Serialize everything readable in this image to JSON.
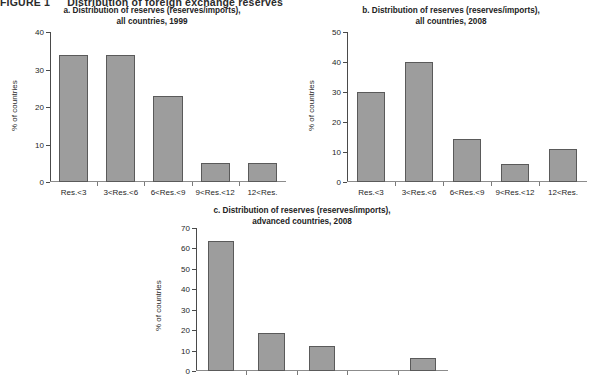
{
  "figure": {
    "label": "FIGURE 1",
    "caption": "Distribution of foreign exchange reserves",
    "ylabel": "% of countries",
    "bar_color": "#9d9d9d",
    "axis_color": "#4a4a4a"
  },
  "chart_data": [
    {
      "id": "a",
      "type": "bar",
      "title": "a. Distribution of reserves (reserves/imports),",
      "subtitle": "all countries, 1999",
      "categories": [
        "Res.<3",
        "3<Res.<6",
        "6<Res.<9",
        "9<Res.<12",
        "12<Res."
      ],
      "values": [
        33.8,
        33.8,
        23.0,
        5.2,
        5.2
      ],
      "xlabel": "",
      "ylabel": "% of countries",
      "ylim": [
        0,
        40
      ],
      "yticks": [
        0,
        10,
        20,
        30,
        40
      ],
      "grid": false,
      "legend": "none"
    },
    {
      "id": "b",
      "type": "bar",
      "title": "b. Distribution of reserves (reserves/imports),",
      "subtitle": "all countries, 2008",
      "categories": [
        "Res.<3",
        "3<Res.<6",
        "6<Res.<9",
        "9<Res.<12",
        "12<Res."
      ],
      "values": [
        30.0,
        40.0,
        14.5,
        6.0,
        11.0
      ],
      "xlabel": "",
      "ylabel": "% of countries",
      "ylim": [
        0,
        50
      ],
      "yticks": [
        0,
        10,
        20,
        30,
        40,
        50
      ],
      "grid": false,
      "legend": "none"
    },
    {
      "id": "c",
      "type": "bar",
      "title": "c. Distribution of reserves (reserves/imports),",
      "subtitle": "advanced countries, 2008",
      "categories": [
        "",
        "",
        "",
        "",
        ""
      ],
      "values": [
        63.5,
        18.5,
        12.2,
        0.0,
        6.5
      ],
      "xlabel": "",
      "ylabel": "% of countries",
      "ylim": [
        0,
        70
      ],
      "yticks": [
        0,
        10,
        20,
        30,
        40,
        50,
        60,
        70
      ],
      "grid": false,
      "legend": "none"
    }
  ]
}
